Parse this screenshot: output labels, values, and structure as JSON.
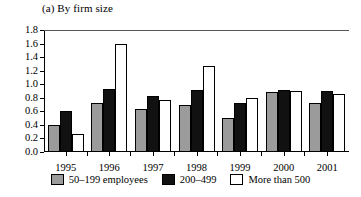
{
  "chart_data": {
    "type": "bar",
    "title": "(a) By firm size",
    "xlabel": "",
    "ylabel": "",
    "ylim": [
      0.0,
      1.8
    ],
    "yticks": [
      "0.0",
      "0.2",
      "0.4",
      "0.6",
      "0.8",
      "1.0",
      "1.2",
      "1.4",
      "1.6",
      "1.8"
    ],
    "grid": false,
    "legend_position": "bottom",
    "categories": [
      "1995",
      "1996",
      "1997",
      "1998",
      "1999",
      "2000",
      "2001"
    ],
    "series": [
      {
        "name": "50–199 employees",
        "color": "#9b9b9b",
        "values": [
          0.4,
          0.72,
          0.63,
          0.7,
          0.5,
          0.88,
          0.72
        ]
      },
      {
        "name": "200–499",
        "color": "#111111",
        "values": [
          0.6,
          0.93,
          0.83,
          0.92,
          0.72,
          0.92,
          0.9
        ]
      },
      {
        "name": "More than 500",
        "color": "#ffffff",
        "values": [
          0.27,
          1.6,
          0.77,
          1.27,
          0.8,
          0.9,
          0.85
        ]
      }
    ]
  }
}
